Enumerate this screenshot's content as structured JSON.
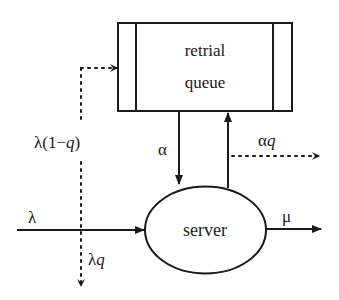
{
  "diagram": {
    "type": "queueing-system-flow",
    "colors": {
      "stroke": "#1a1a1a",
      "background": "#ffffff"
    },
    "nodes": {
      "retrial_queue": {
        "label_line1": "retrial",
        "label_line2": "queue"
      },
      "server": {
        "label": "server"
      }
    },
    "edges": {
      "arrival": {
        "label": "λ",
        "style": "solid"
      },
      "to_orbit": {
        "label": "λ(1−q)",
        "style": "dotted"
      },
      "lost_arrival": {
        "label_sym": "λ",
        "label_var": "q",
        "style": "dotted"
      },
      "retrial": {
        "label": "α",
        "style": "solid"
      },
      "orbit_loss": {
        "label_sym": "α",
        "label_var": "q",
        "style": "dotted"
      },
      "return_to_orbit": {
        "label": "",
        "style": "solid"
      },
      "service": {
        "label": "μ",
        "style": "solid"
      }
    }
  }
}
